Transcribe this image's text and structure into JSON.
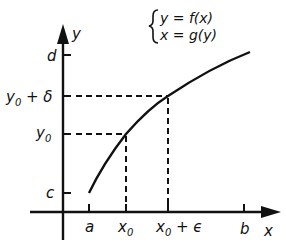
{
  "equations": {
    "line1": "y = f(x)",
    "line2": "x = g(y)"
  },
  "axes": {
    "x_label": "x",
    "y_label": "y"
  },
  "y_ticks": {
    "d": "d",
    "y0_plus_delta_base": "y",
    "y0_plus_delta_sub": "0",
    "y0_plus_delta_rest": " + δ",
    "y0_base": "y",
    "y0_sub": "0",
    "c": "c"
  },
  "x_ticks": {
    "a": "a",
    "x0_base": "x",
    "x0_sub": "0",
    "x0_plus_eps_base": "x",
    "x0_plus_eps_sub": "0",
    "x0_plus_eps_rest": " + ϵ",
    "b": "b"
  },
  "colors": {
    "ink": "#111111",
    "background": "#ffffff"
  }
}
